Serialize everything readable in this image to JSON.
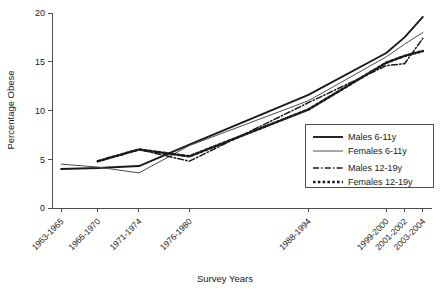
{
  "chart_data": {
    "type": "line",
    "title": "",
    "xlabel": "Survey Years",
    "ylabel": "Percentage Obese",
    "categories": [
      "1963-1965",
      "1966-1970",
      "1971-1974",
      "1976-1980",
      "1988-1994",
      "1999-2000",
      "2001-2002",
      "2003-2004"
    ],
    "x_positions": [
      1964,
      1968,
      1972.5,
      1978,
      1991,
      1999.5,
      2001.5,
      2003.5
    ],
    "xlim": [
      1963,
      2004.5
    ],
    "ylim": [
      0,
      20
    ],
    "yticks": [
      0,
      5,
      10,
      15,
      20
    ],
    "ytick_labels": [
      "0",
      "5",
      "10",
      "15",
      "20"
    ],
    "grid": false,
    "legend_position": "center-right",
    "series": [
      {
        "name": "Males 6-11y",
        "style": "solid-thick",
        "color": "#1a1a1a",
        "x": [
          1964,
          1968,
          1972.5,
          1978,
          1991,
          1999.5,
          2001.5,
          2003.5
        ],
        "values": [
          4.0,
          4.1,
          4.3,
          6.5,
          11.6,
          15.9,
          17.5,
          19.6
        ]
      },
      {
        "name": "Females 6-11y",
        "style": "solid-thin",
        "color": "#4d4d4d",
        "x": [
          1964,
          1968,
          1972.5,
          1978,
          1991,
          1999.5,
          2001.5,
          2003.5
        ],
        "values": [
          4.5,
          4.2,
          3.6,
          6.4,
          11.0,
          15.5,
          16.8,
          18.0
        ]
      },
      {
        "name": "Males 12-19y",
        "style": "dash-dot",
        "color": "#1a1a1a",
        "x": [
          1968,
          1972.5,
          1978,
          1991,
          1999.5,
          2001.5,
          2003.5
        ],
        "values": [
          4.8,
          6.0,
          4.8,
          10.8,
          14.6,
          14.8,
          17.4
        ]
      },
      {
        "name": "Females 12-19y",
        "style": "dotted-thick",
        "color": "#1a1a1a",
        "x": [
          1968,
          1972.5,
          1978,
          1991,
          1999.5,
          2001.5,
          2003.5
        ],
        "values": [
          4.8,
          6.0,
          5.3,
          10.1,
          14.9,
          15.6,
          16.1
        ]
      }
    ]
  },
  "legend": {
    "entries": [
      {
        "label": "Males 6-11y"
      },
      {
        "label": "Females 6-11y"
      },
      {
        "label": "Males 12-19y"
      },
      {
        "label": "Females 12-19y"
      }
    ]
  },
  "axes": {
    "y_title": "Percentage Obese",
    "x_title": "Survey Years"
  },
  "colors": {
    "axis": "#4d4d4d",
    "ink": "#1a1a1a",
    "thin_line": "#4d4d4d",
    "background": "#ffffff"
  }
}
